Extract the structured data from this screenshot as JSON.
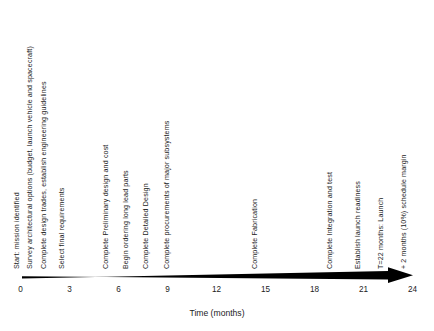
{
  "figure": {
    "name": "mission-schedule-timeline",
    "type": "horizontal-timeline-arrow"
  },
  "axis": {
    "title": "Time (months)",
    "unit": "months",
    "min": 0,
    "max": 24,
    "tick_step": 3,
    "tick_labels": [
      "0",
      "3",
      "6",
      "9",
      "12",
      "15",
      "18",
      "21",
      "24"
    ],
    "arrow_color": "#000000",
    "arrow_direction": "right"
  },
  "milestones": [
    {
      "label": "Start: mission identified",
      "month": 0
    },
    {
      "label": "Survey architectural options (budget, launch vehicle and spacecraft)",
      "month": 0.85
    },
    {
      "label": "Complete design trades, establish engineering guidelines",
      "month": 1.7
    },
    {
      "label": "Select final requirements",
      "month": 2.8
    },
    {
      "label": "Complete Preliminary design and cost",
      "month": 5.5
    },
    {
      "label": "Begin ordering long lead parts",
      "month": 6.7
    },
    {
      "label": "Complete Detailed Design",
      "month": 7.9
    },
    {
      "label": "Complete procurements of major subsystems",
      "month": 9.2
    },
    {
      "label": "Complete Fabrication",
      "month": 14.6
    },
    {
      "label": "Complete Integration and test",
      "month": 19.2
    },
    {
      "label": "Establish launch readiness",
      "month": 20.9
    },
    {
      "label": "T=22 months: Launch",
      "month": 22.3
    },
    {
      "label": "+ 2 months (10%) schedule margin",
      "month": 23.7
    }
  ],
  "chart_data": {
    "type": "timeline",
    "title": "",
    "xlabel": "Time (months)",
    "ylabel": "",
    "xlim": [
      0,
      24
    ],
    "grid": false,
    "legend": "none",
    "categories": [
      "Start: mission identified",
      "Survey architectural options (budget, launch vehicle and spacecraft)",
      "Complete design trades, establish engineering guidelines",
      "Select final requirements",
      "Complete Preliminary design and cost",
      "Begin ordering long lead parts",
      "Complete Detailed Design",
      "Complete procurements of major subsystems",
      "Complete Fabrication",
      "Complete Integration and test",
      "Establish launch readiness",
      "T=22 months: Launch",
      "+ 2 months (10%) schedule margin"
    ],
    "values": [
      0,
      0.85,
      1.7,
      2.8,
      5.5,
      6.7,
      7.9,
      9.2,
      14.6,
      19.2,
      20.9,
      22.3,
      23.7
    ],
    "tick_values": [
      0,
      3,
      6,
      9,
      12,
      15,
      18,
      21,
      24
    ]
  }
}
